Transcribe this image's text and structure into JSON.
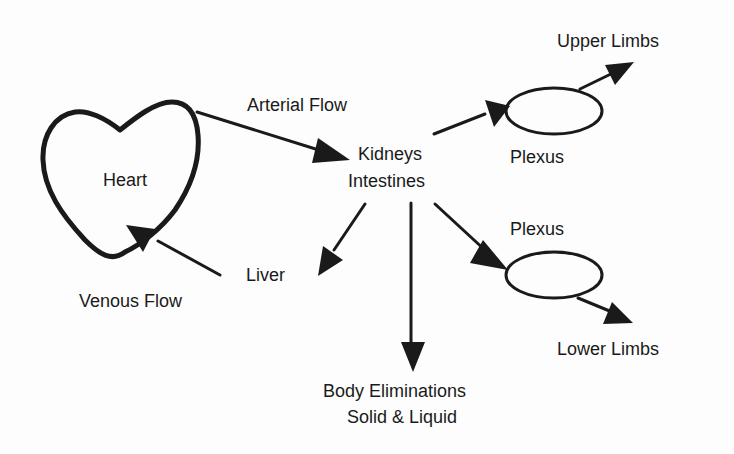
{
  "diagram": {
    "title": "",
    "colors": {
      "ink": "#1a1a1a",
      "background": "#fdfdfd"
    },
    "nodes": {
      "heart": {
        "label": "Heart",
        "shape": "heart"
      },
      "kidneys_intestines": {
        "label_line1": "Kidneys",
        "label_line2": "Intestines"
      },
      "liver": {
        "label": "Liver"
      },
      "body_eliminations": {
        "label_line1": "Body Eliminations",
        "label_line2": "Solid & Liquid"
      },
      "plexus_upper": {
        "label": "Plexus",
        "shape": "ellipse"
      },
      "plexus_lower": {
        "label": "Plexus",
        "shape": "ellipse"
      },
      "upper_limbs": {
        "label": "Upper Limbs"
      },
      "lower_limbs": {
        "label": "Lower Limbs"
      }
    },
    "edge_labels": {
      "arterial_flow": "Arterial Flow",
      "venous_flow": "Venous Flow"
    },
    "edges": [
      {
        "from": "heart",
        "to": "kidneys_intestines",
        "label": "Arterial Flow"
      },
      {
        "from": "kidneys_intestines",
        "to": "plexus_upper"
      },
      {
        "from": "plexus_upper",
        "to": "upper_limbs"
      },
      {
        "from": "kidneys_intestines",
        "to": "liver"
      },
      {
        "from": "kidneys_intestines",
        "to": "body_eliminations"
      },
      {
        "from": "kidneys_intestines",
        "to": "plexus_lower"
      },
      {
        "from": "plexus_lower",
        "to": "lower_limbs"
      },
      {
        "from": "liver_region",
        "to": "heart",
        "label": "Venous Flow"
      }
    ]
  }
}
